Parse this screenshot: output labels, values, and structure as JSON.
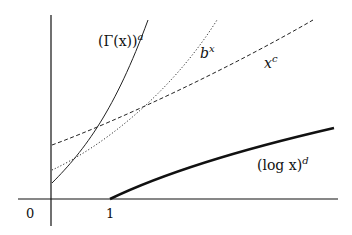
{
  "diagram": {
    "title": "",
    "axes": {
      "x_ticks": [
        {
          "label": "0"
        },
        {
          "label": "1"
        }
      ]
    },
    "curves": [
      {
        "id": "gamma",
        "label_base": "(Γ(x))",
        "label_sup": "a",
        "style": "solid-thin"
      },
      {
        "id": "exp",
        "label_base": "b",
        "label_sup": "x",
        "style": "dotted"
      },
      {
        "id": "power",
        "label_base": "x",
        "label_sup": "c",
        "style": "dashed"
      },
      {
        "id": "log",
        "label_base": "(log x)",
        "label_sup": "d",
        "style": "solid-thick"
      }
    ],
    "colors": {
      "ink": "#111111",
      "background": "#ffffff"
    }
  }
}
